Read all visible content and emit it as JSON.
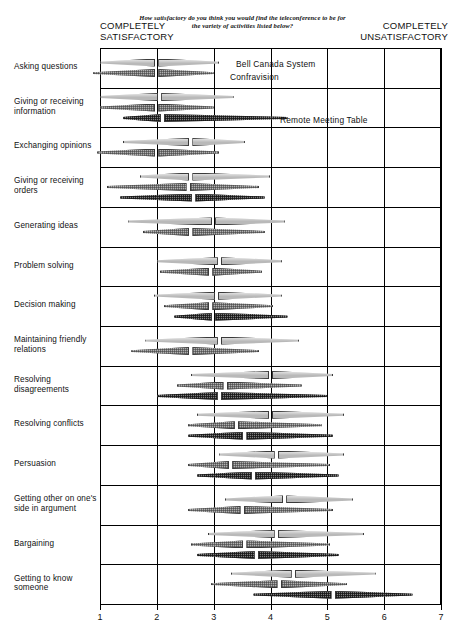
{
  "header": {
    "question": "How satisfactory do you think you would find the teleconference to be for the variety of activities listed below?",
    "left_anchor_line1": "COMPLETELY",
    "left_anchor_line2": "SATISFACTORY",
    "right_anchor_line1": "COMPLETELY",
    "right_anchor_line2": "UNSATISFACTORY"
  },
  "legend": [
    {
      "name": "Bell Canada System",
      "key": "bell",
      "color": "#b9b9b9"
    },
    {
      "name": "Confravision",
      "key": "confravision",
      "color": "#b0b0b0"
    },
    {
      "name": "Remote Meeting Table",
      "key": "rmt",
      "color": "#7d7d7d"
    }
  ],
  "axis": {
    "ticks": [
      "1",
      "2",
      "3",
      "4",
      "5",
      "6",
      "7"
    ],
    "min": 1,
    "max": 7
  },
  "chart_data": {
    "type": "bar",
    "title": "How satisfactory do you think you would find the teleconference to be for the variety of activities listed below?",
    "xlabel": "",
    "ylabel": "",
    "xlim": [
      1,
      7
    ],
    "grid": true,
    "legend_position": "inline-top",
    "note": "Each bar is a lens/diamond range bar split at the median; low = start, high = end, med = median marker.",
    "series_names": [
      "Bell Canada System",
      "Confravision",
      "Remote Meeting Table"
    ],
    "categories": [
      "Asking questions",
      "Giving or receiving information",
      "Exchanging opinions",
      "Giving or receiving orders",
      "Generating ideas",
      "Problem solving",
      "Decision making",
      "Maintaining friendly relations",
      "Resolving disagreements",
      "Resolving conflicts",
      "Persuasion",
      "Getting other on one's side in argument",
      "Bargaining",
      "Getting to know someone"
    ],
    "rows": [
      {
        "label": "Asking questions",
        "label_lines": [
          "Asking questions"
        ],
        "bars": [
          {
            "series": "Bell Canada System",
            "low": 1.0,
            "med": 2.0,
            "high": 3.1
          },
          {
            "series": "Confravision",
            "low": 0.88,
            "med": 2.0,
            "high": 3.0
          }
        ]
      },
      {
        "label": "Giving or receiving information",
        "label_lines": [
          "Giving or receiving",
          "information"
        ],
        "bars": [
          {
            "series": "Bell Canada System",
            "low": 1.0,
            "med": 2.05,
            "high": 3.35
          },
          {
            "series": "Confravision",
            "low": 1.0,
            "med": 2.0,
            "high": 3.0
          },
          {
            "series": "Remote Meeting Table",
            "low": 1.4,
            "med": 2.1,
            "high": 4.3
          }
        ]
      },
      {
        "label": "Exchanging opinions",
        "label_lines": [
          "Exchanging opinions"
        ],
        "bars": [
          {
            "series": "Bell Canada System",
            "low": 1.4,
            "med": 2.6,
            "high": 3.55
          },
          {
            "series": "Confravision",
            "low": 0.95,
            "med": 2.0,
            "high": 3.1
          }
        ]
      },
      {
        "label": "Giving or receiving orders",
        "label_lines": [
          "Giving or receiving",
          "orders"
        ],
        "bars": [
          {
            "series": "Bell Canada System",
            "low": 1.7,
            "med": 2.6,
            "high": 4.0
          },
          {
            "series": "Confravision",
            "low": 1.12,
            "med": 2.55,
            "high": 3.8
          },
          {
            "series": "Remote Meeting Table",
            "low": 1.35,
            "med": 2.65,
            "high": 3.9
          }
        ]
      },
      {
        "label": "Generating ideas",
        "label_lines": [
          "Generating ideas"
        ],
        "bars": [
          {
            "series": "Bell Canada System",
            "low": 1.5,
            "med": 3.0,
            "high": 4.25
          },
          {
            "series": "Confravision",
            "low": 1.75,
            "med": 2.6,
            "high": 3.9
          }
        ]
      },
      {
        "label": "Problem solving",
        "label_lines": [
          "Problem solving"
        ],
        "bars": [
          {
            "series": "Bell Canada System",
            "low": 2.0,
            "med": 3.1,
            "high": 4.2
          },
          {
            "series": "Confravision",
            "low": 2.05,
            "med": 2.95,
            "high": 3.85
          }
        ]
      },
      {
        "label": "Decision making",
        "label_lines": [
          "Decision making"
        ],
        "bars": [
          {
            "series": "Bell Canada System",
            "low": 1.95,
            "med": 3.05,
            "high": 4.2
          },
          {
            "series": "Confravision",
            "low": 2.12,
            "med": 2.95,
            "high": 4.05
          },
          {
            "series": "Remote Meeting Table",
            "low": 2.3,
            "med": 3.0,
            "high": 4.3
          }
        ]
      },
      {
        "label": "Maintaining friendly relations",
        "label_lines": [
          "Maintaining friendly",
          "relations"
        ],
        "bars": [
          {
            "series": "Bell Canada System",
            "low": 1.8,
            "med": 3.1,
            "high": 4.5
          },
          {
            "series": "Confravision",
            "low": 1.55,
            "med": 2.6,
            "high": 3.8
          }
        ]
      },
      {
        "label": "Resolving disagreements",
        "label_lines": [
          "Resolving",
          "disagreements"
        ],
        "bars": [
          {
            "series": "Bell Canada System",
            "low": 2.6,
            "med": 4.0,
            "high": 5.1
          },
          {
            "series": "Confravision",
            "low": 2.35,
            "med": 3.2,
            "high": 4.55
          },
          {
            "series": "Remote Meeting Table",
            "low": 2.0,
            "med": 3.1,
            "high": 5.0
          }
        ]
      },
      {
        "label": "Resolving conflicts",
        "label_lines": [
          "Resolving conflicts"
        ],
        "bars": [
          {
            "series": "Bell Canada System",
            "low": 2.7,
            "med": 4.0,
            "high": 5.3
          },
          {
            "series": "Confravision",
            "low": 2.55,
            "med": 3.4,
            "high": 4.9
          },
          {
            "series": "Remote Meeting Table",
            "low": 2.55,
            "med": 3.55,
            "high": 5.1
          }
        ]
      },
      {
        "label": "Persuasion",
        "label_lines": [
          "Persuasion"
        ],
        "bars": [
          {
            "series": "Bell Canada System",
            "low": 3.1,
            "med": 4.1,
            "high": 5.3
          },
          {
            "series": "Confravision",
            "low": 2.55,
            "med": 3.3,
            "high": 5.05
          },
          {
            "series": "Remote Meeting Table",
            "low": 2.7,
            "med": 3.7,
            "high": 5.2
          }
        ]
      },
      {
        "label": "Getting other on one's side in argument",
        "label_lines": [
          "Getting other on one's",
          "side in argument"
        ],
        "bars": [
          {
            "series": "Bell Canada System",
            "low": 3.2,
            "med": 4.25,
            "high": 5.45
          },
          {
            "series": "Confravision",
            "low": 2.55,
            "med": 3.5,
            "high": 5.1
          }
        ]
      },
      {
        "label": "Bargaining",
        "label_lines": [
          "Bargaining"
        ],
        "bars": [
          {
            "series": "Bell Canada System",
            "low": 2.9,
            "med": 4.1,
            "high": 5.65
          },
          {
            "series": "Confravision",
            "low": 2.6,
            "med": 3.55,
            "high": 5.05
          },
          {
            "series": "Remote Meeting Table",
            "low": 2.7,
            "med": 3.75,
            "high": 5.2
          }
        ]
      },
      {
        "label": "Getting to know someone",
        "label_lines": [
          "Getting to know",
          "someone"
        ],
        "bars": [
          {
            "series": "Bell Canada System",
            "low": 3.3,
            "med": 4.4,
            "high": 5.85
          },
          {
            "series": "Confravision",
            "low": 2.95,
            "med": 4.15,
            "high": 5.35
          },
          {
            "series": "Remote Meeting Table",
            "low": 3.7,
            "med": 5.1,
            "high": 6.5
          }
        ]
      }
    ]
  }
}
